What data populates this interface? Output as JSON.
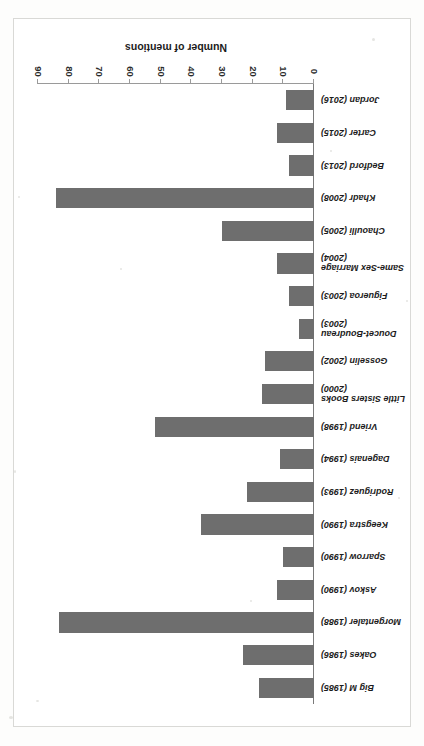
{
  "figure": {
    "orientation_note": "rotated-180",
    "bar_color": "#6E6E6E",
    "frame_color": "#D9D9D6"
  },
  "chart_data": {
    "type": "bar",
    "orientation": "horizontal",
    "title": "",
    "xlabel": "Number of mentions",
    "ylabel": "",
    "xlim": [
      0,
      90
    ],
    "xticks": [
      0,
      10,
      20,
      30,
      40,
      50,
      60,
      70,
      80,
      90
    ],
    "grid": false,
    "legend": null,
    "categories": [
      "Big M (1985)",
      "Oakes (1986)",
      "Morgentaler (1988)",
      "Askov (1990)",
      "Sparrow (1990)",
      "Keegstra (1990)",
      "Rodriguez (1993)",
      "Dagenais (1994)",
      "Vriend (1998)",
      "Little Sisters Books\n(2000)",
      "Gosselin (2002)",
      "Doucet-Boudreau\n(2003)",
      "Figueroa (2003)",
      "Same-Sex Marriage\n(2004)",
      "Chaoulli (2005)",
      "Khadr (2008)",
      "Bedford (2013)",
      "Carter (2015)",
      "Jordan (2016)"
    ],
    "values": [
      18,
      23,
      83,
      12,
      10,
      37,
      22,
      11,
      52,
      17,
      16,
      5,
      8,
      12,
      30,
      84,
      8,
      12,
      9
    ]
  },
  "axis": {
    "tick_labels": [
      "0",
      "10",
      "20",
      "30",
      "40",
      "50",
      "60",
      "70",
      "80",
      "90"
    ],
    "title": "Number of mentions"
  }
}
